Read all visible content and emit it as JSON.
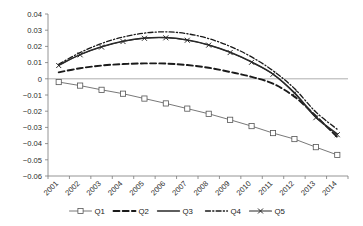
{
  "chart_data": {
    "type": "line",
    "title": "",
    "subtitle": "",
    "xlabel": "",
    "ylabel": "",
    "grid": false,
    "legend_position": "bottom-center",
    "ylim": [
      -0.06,
      0.04
    ],
    "ytick_labels": [
      "0.04",
      "0.03",
      "0.02",
      "0.01",
      "0",
      "−0.01",
      "−0.02",
      "−0.03",
      "−0.04",
      "−0.05",
      "−0.06"
    ],
    "ytick_values": [
      0.04,
      0.03,
      0.02,
      0.01,
      0,
      -0.01,
      -0.02,
      -0.03,
      -0.04,
      -0.05,
      -0.06
    ],
    "categories": [
      "2001",
      "2002",
      "2003",
      "2004",
      "2005",
      "2006",
      "2007",
      "2008",
      "2009",
      "2010",
      "2011",
      "2012",
      "2013",
      "2014"
    ],
    "zero_reference_line": 0,
    "series": [
      {
        "name": "Q1",
        "style": "thin-solid-square-markers",
        "marker": "square",
        "color": "#555555",
        "values": [
          -0.002,
          -0.0042,
          -0.0068,
          -0.0092,
          -0.0122,
          -0.0152,
          -0.0184,
          -0.0216,
          -0.0253,
          -0.0292,
          -0.0335,
          -0.0372,
          -0.0422,
          -0.047
        ]
      },
      {
        "name": "Q2",
        "style": "thick-dashed",
        "marker": "none",
        "color": "#1a1a1a",
        "values": [
          0.004,
          0.0065,
          0.0082,
          0.0091,
          0.0095,
          0.0094,
          0.0085,
          0.0068,
          0.0042,
          0.0012,
          -0.003,
          -0.011,
          -0.023,
          -0.036
        ]
      },
      {
        "name": "Q3",
        "style": "thin-solid",
        "marker": "none",
        "color": "#2a2a2a",
        "values": [
          0.0085,
          0.015,
          0.0198,
          0.0232,
          0.0252,
          0.0255,
          0.024,
          0.021,
          0.0165,
          0.0105,
          0.003,
          -0.0085,
          -0.0235,
          -0.034
        ]
      },
      {
        "name": "Q4",
        "style": "dash-dot",
        "marker": "none",
        "color": "#1a1a1a",
        "values": [
          0.009,
          0.0162,
          0.0218,
          0.0258,
          0.0282,
          0.029,
          0.0278,
          0.0248,
          0.02,
          0.0135,
          0.005,
          -0.006,
          -0.0205,
          -0.0312
        ]
      },
      {
        "name": "Q5",
        "style": "thin-solid-x-markers",
        "marker": "x",
        "color": "#2a2a2a",
        "values": [
          0.0082,
          0.0148,
          0.0196,
          0.023,
          0.025,
          0.0253,
          0.0238,
          0.0208,
          0.0162,
          0.0102,
          0.0028,
          -0.009,
          -0.024,
          -0.0345
        ]
      }
    ],
    "legend": [
      {
        "label": "Q1",
        "marker": "square",
        "line": "thin-solid"
      },
      {
        "label": "Q2",
        "marker": "none",
        "line": "thick-dashed"
      },
      {
        "label": "Q3",
        "marker": "none",
        "line": "thin-solid"
      },
      {
        "label": "Q4",
        "marker": "none",
        "line": "dash-dot"
      },
      {
        "label": "Q5",
        "marker": "x",
        "line": "thin-solid"
      }
    ],
    "colors": {
      "axis": "#7a7a7a",
      "zero_line": "#9a9a9a",
      "text": "#1a1a1a",
      "background": "#ffffff"
    }
  }
}
